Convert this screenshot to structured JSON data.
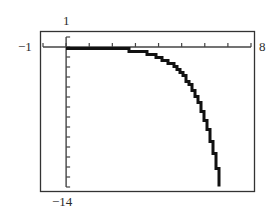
{
  "chart_data": {
    "type": "line",
    "title": "",
    "xlabel": "",
    "ylabel": "",
    "xlim": [
      -1,
      8
    ],
    "ylim": [
      -14,
      1
    ],
    "x_tick_step": 1,
    "y_tick_step": 1,
    "grid": false,
    "legend": null,
    "window_labels": {
      "xmin": "−1",
      "xmax": "8",
      "ymax": "1",
      "ymin": "−14"
    },
    "series": [
      {
        "name": "f(x)",
        "description": "decreasing exponential-type curve, nearly flat near 0 then plunging",
        "x": [
          0,
          1,
          2,
          3,
          3.5,
          4,
          4.5,
          5,
          5.5,
          6,
          6.3,
          6.6
        ],
        "y": [
          -0.02,
          -0.05,
          -0.14,
          -0.38,
          -0.63,
          -1.04,
          -1.71,
          -2.82,
          -4.65,
          -7.67,
          -10.3,
          -13.9
        ]
      }
    ]
  },
  "colors": {
    "frame": "#333333",
    "axis": "#444444",
    "curve": "#111111",
    "background": "#ffffff"
  }
}
